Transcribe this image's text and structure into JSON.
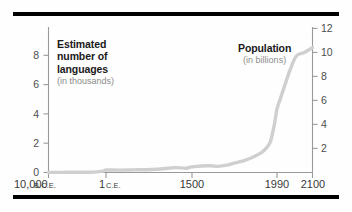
{
  "figure": {
    "background_color": "#fefefe",
    "rule_color": "#000000",
    "curve_color": "#cfcfcf",
    "axis_color": "#9a9a9a",
    "tick_label_color": "#4d4d4d"
  },
  "left_annotation": {
    "line1": "Estimated",
    "line2": "number of",
    "line3": "languages",
    "units": "(in thousands)"
  },
  "right_annotation": {
    "title": "Population",
    "units": "(in billions)"
  },
  "chart_data": {
    "type": "line",
    "title": "",
    "subtitle": "",
    "xlabel": "",
    "ylabel": "Estimated number of languages (in thousands)",
    "y2label": "Population (in billions)",
    "grid": false,
    "legend": "none",
    "x_tick_labels": [
      {
        "value": "10,000",
        "era": "B.C.E.",
        "x": -10000
      },
      {
        "value": "1",
        "era": "C.E.",
        "x": 1
      },
      {
        "value": "1500",
        "era": "",
        "x": 1500
      },
      {
        "value": "1990",
        "era": "",
        "x": 1990
      },
      {
        "value": "2100",
        "era": "",
        "x": 2100
      }
    ],
    "ylim": [
      0,
      9.6
    ],
    "y_tick_labels": [
      "0",
      "2",
      "4",
      "6",
      "8"
    ],
    "y_tick_values": [
      0,
      2,
      4,
      6,
      8
    ],
    "y2lim": [
      0,
      13.1
    ],
    "y2_tick_labels": [
      "2",
      "4",
      "6",
      "8",
      "10",
      "12"
    ],
    "y2_tick_values": [
      2,
      4,
      6,
      8,
      10,
      12
    ],
    "series": [
      {
        "name": "Population",
        "axis": "right",
        "units": "billions",
        "x": [
          -10000,
          -8000,
          -6000,
          -4000,
          -2000,
          -500,
          1,
          200,
          500,
          800,
          1000,
          1200,
          1400,
          1500,
          1600,
          1650,
          1700,
          1750,
          1800,
          1850,
          1900,
          1927,
          1950,
          1960,
          1975,
          1990,
          2000,
          2011,
          2030,
          2050,
          2075,
          2100
        ],
        "values": [
          0.004,
          0.005,
          0.007,
          0.01,
          0.027,
          0.1,
          0.2,
          0.19,
          0.21,
          0.24,
          0.3,
          0.4,
          0.35,
          0.46,
          0.55,
          0.5,
          0.6,
          0.79,
          0.98,
          1.26,
          1.65,
          2.0,
          2.5,
          3.0,
          4.0,
          5.3,
          6.1,
          7.0,
          8.5,
          9.7,
          10.0,
          10.4
        ]
      }
    ]
  }
}
